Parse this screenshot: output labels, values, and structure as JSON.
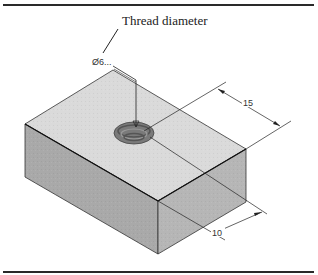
{
  "figure": {
    "callout_label": "Thread diameter",
    "dimensions": {
      "thread": "Ø6...",
      "width": "15",
      "depth": "10"
    },
    "colors": {
      "top_face": "#d9d9d9",
      "left_face": "#a8a8a8",
      "right_face": "#b4b4b4",
      "hole": "#6f6f6f",
      "line": "#222222"
    }
  }
}
